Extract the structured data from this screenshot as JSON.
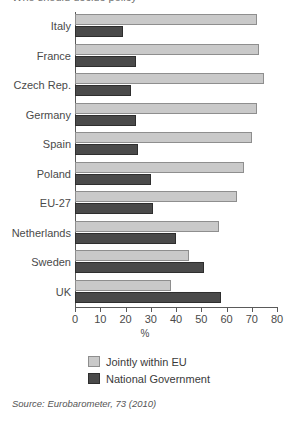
{
  "title_sliver": "Who should decide policy",
  "chart_data": {
    "type": "bar",
    "orientation": "horizontal",
    "title": "",
    "xlabel": "%",
    "ylabel": "",
    "xlim": [
      0,
      80
    ],
    "xticks": [
      0,
      10,
      20,
      30,
      40,
      50,
      60,
      70,
      80
    ],
    "grid": false,
    "legend_position": "bottom",
    "categories": [
      "Italy",
      "France",
      "Czech Rep.",
      "Germany",
      "Spain",
      "Poland",
      "EU-27",
      "Netherlands",
      "Sweden",
      "UK"
    ],
    "series": [
      {
        "name": "Jointly within EU",
        "color": "#c9c9c9",
        "values": [
          72,
          73,
          75,
          72,
          70,
          67,
          64,
          57,
          45,
          38
        ]
      },
      {
        "name": "National Government",
        "color": "#4a4a4a",
        "values": [
          19,
          24,
          22,
          24,
          25,
          30,
          31,
          40,
          51,
          58
        ]
      }
    ]
  },
  "source": {
    "prefix": "Source: ",
    "publication": "Eurobarometer",
    "suffix": ", 73 (2010)"
  }
}
